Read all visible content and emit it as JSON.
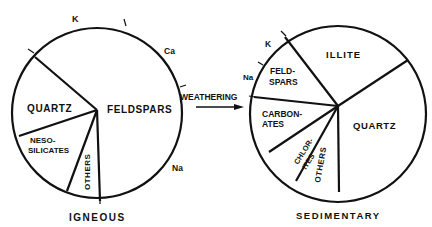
{
  "figure": {
    "arrow_label": "WEATHERING",
    "igneous": {
      "title": "IGNEOUS",
      "segments": [
        {
          "label": "FELDSPARS",
          "sublabels": [
            "K",
            "Ca",
            "Na"
          ]
        },
        {
          "label": "QUARTZ"
        },
        {
          "label_line1": "NESO-",
          "label_line2": "SILICATES"
        },
        {
          "label": "OTHERS"
        }
      ]
    },
    "sedimentary": {
      "title": "SEDIMENTARY",
      "segments": [
        {
          "label": "ILLITE"
        },
        {
          "label": "QUARTZ"
        },
        {
          "label": "OTHERS"
        },
        {
          "label_line1": "CHLOR-",
          "label_line2": "ITES"
        },
        {
          "label_line1": "CARBON-",
          "label_line2": "ATES"
        },
        {
          "label_line1": "FELD-",
          "label_line2": "SPARS",
          "sublabels": [
            "K",
            "Na"
          ]
        }
      ]
    }
  }
}
